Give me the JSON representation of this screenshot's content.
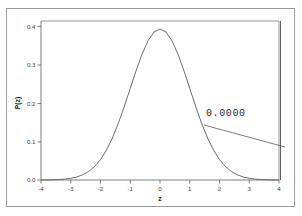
{
  "window": {
    "frame_color": "#9a9a9a",
    "background": "#ffffff"
  },
  "chart_data": {
    "type": "line",
    "title": "",
    "subtitle": "",
    "xlabel": "z",
    "ylabel": "P(z)",
    "xlim": [
      -4,
      4
    ],
    "ylim": [
      0.0,
      0.42
    ],
    "grid": false,
    "legend": "none",
    "x_ticks": [
      "-4",
      "-3",
      "-2",
      "-1",
      "0",
      "1",
      "2",
      "3",
      "4"
    ],
    "x_tick_values": [
      -4,
      -3,
      -2,
      -1,
      0,
      1,
      2,
      3,
      4
    ],
    "y_ticks": [
      "0.0",
      "0.1",
      "0.2",
      "0.3",
      "0.4"
    ],
    "y_tick_values": [
      0.0,
      0.1,
      0.2,
      0.3,
      0.4
    ],
    "series": [
      {
        "name": "standard normal density",
        "x": [
          -4.0,
          -3.8,
          -3.6,
          -3.4,
          -3.2,
          -3.0,
          -2.8,
          -2.6,
          -2.4,
          -2.2,
          -2.0,
          -1.8,
          -1.6,
          -1.4,
          -1.2,
          -1.0,
          -0.8,
          -0.6,
          -0.4,
          -0.2,
          0.0,
          0.2,
          0.4,
          0.6,
          0.8,
          1.0,
          1.2,
          1.4,
          1.6,
          1.8,
          2.0,
          2.2,
          2.4,
          2.6,
          2.8,
          3.0,
          3.2,
          3.4,
          3.6,
          3.8,
          4.0
        ],
        "values": [
          0.0001,
          0.0003,
          0.0006,
          0.0012,
          0.0024,
          0.0044,
          0.0079,
          0.0136,
          0.0224,
          0.0355,
          0.054,
          0.079,
          0.1109,
          0.1497,
          0.1942,
          0.242,
          0.2897,
          0.3332,
          0.3683,
          0.391,
          0.3989,
          0.391,
          0.3683,
          0.3332,
          0.2897,
          0.242,
          0.1942,
          0.1497,
          0.1109,
          0.079,
          0.054,
          0.0355,
          0.0224,
          0.0136,
          0.0079,
          0.0044,
          0.0024,
          0.0012,
          0.0006,
          0.0003,
          0.0001
        ]
      }
    ],
    "annotations": [
      {
        "name": "tail-probability",
        "text": "0.0000",
        "points_to_x": 4.0,
        "description": "leader line from label to vertical marker at z = 4"
      }
    ],
    "markers": [
      {
        "name": "z-critical-marker",
        "x": 4.05,
        "orientation": "vertical"
      }
    ]
  }
}
